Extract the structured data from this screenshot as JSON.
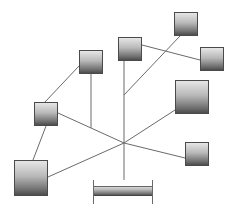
{
  "diagram": {
    "type": "network-topology",
    "style": {
      "background": "#ffffff",
      "line_color": "#6a6a6a",
      "node_gradient_top": "#e6e6e6",
      "node_gradient_bottom": "#4c4c4c"
    },
    "hub": {
      "x": 124,
      "y": 143
    },
    "nodes": [
      {
        "id": "A",
        "x": 79,
        "y": 50,
        "w": 24,
        "h": 24
      },
      {
        "id": "B",
        "x": 118,
        "y": 37,
        "w": 24,
        "h": 24
      },
      {
        "id": "C",
        "x": 174,
        "y": 12,
        "w": 24,
        "h": 24
      },
      {
        "id": "D",
        "x": 200,
        "y": 47,
        "w": 24,
        "h": 24
      },
      {
        "id": "E",
        "x": 175,
        "y": 80,
        "w": 34,
        "h": 34
      },
      {
        "id": "F",
        "x": 185,
        "y": 142,
        "w": 24,
        "h": 24
      },
      {
        "id": "G",
        "x": 34,
        "y": 102,
        "w": 24,
        "h": 24
      },
      {
        "id": "H",
        "x": 14,
        "y": 160,
        "w": 34,
        "h": 36
      }
    ],
    "bus": {
      "x": 93,
      "y": 186,
      "w": 59,
      "h": 10,
      "cap_top": 180,
      "cap_bottom": 204
    },
    "edges": [
      {
        "from": "A",
        "to": "A-drop",
        "x1": 91,
        "y1": 74,
        "x2": 91,
        "y2": 128
      },
      {
        "from": "B",
        "to": "bus",
        "x1": 124,
        "y1": 61,
        "x2": 124,
        "y2": 180
      },
      {
        "from": "C",
        "to": "B-line",
        "x1": 180,
        "y1": 36,
        "x2": 124,
        "y2": 95
      },
      {
        "from": "B",
        "to": "D",
        "x1": 142,
        "y1": 45,
        "x2": 200,
        "y2": 60
      },
      {
        "from": "A",
        "to": "G",
        "x1": 79,
        "y1": 66,
        "x2": 45,
        "y2": 102
      },
      {
        "from": "G",
        "to": "H",
        "x1": 46,
        "y1": 126,
        "x2": 33,
        "y2": 160
      },
      {
        "from": "G",
        "to": "hub",
        "x1": 58,
        "y1": 113,
        "x2": 124,
        "y2": 143
      },
      {
        "from": "H",
        "to": "hub",
        "x1": 48,
        "y1": 177,
        "x2": 124,
        "y2": 143
      },
      {
        "from": "hub",
        "to": "E",
        "x1": 124,
        "y1": 143,
        "x2": 175,
        "y2": 110
      },
      {
        "from": "hub",
        "to": "F",
        "x1": 124,
        "y1": 143,
        "x2": 185,
        "y2": 158
      }
    ]
  }
}
